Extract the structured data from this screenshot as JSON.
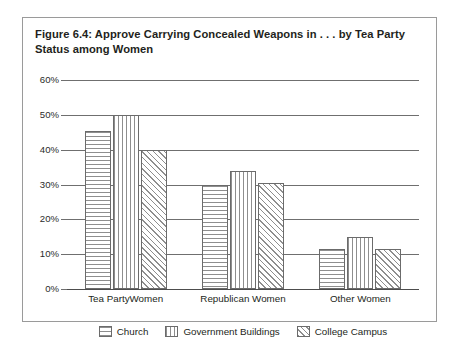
{
  "figure": {
    "title": "Figure 6.4: Approve Carrying Concealed Weapons in . . . by Tea Party Status among Women",
    "border_color": "#9a9a9a"
  },
  "chart_data": {
    "type": "bar",
    "title": "Figure 6.4: Approve Carrying Concealed Weapons in . . . by Tea Party Status among Women",
    "xlabel": "",
    "ylabel": "",
    "categories": [
      "Tea PartyWomen",
      "Republican Women",
      "Other Women"
    ],
    "series": [
      {
        "name": "Church",
        "pattern": "horizontal-lines",
        "values": [
          45.5,
          30.0,
          11.5
        ]
      },
      {
        "name": "Government Buildings",
        "pattern": "vertical-lines",
        "values": [
          50.0,
          34.0,
          15.0
        ]
      },
      {
        "name": "College Campus",
        "pattern": "diagonal-hatch",
        "values": [
          40.0,
          30.5,
          11.5
        ]
      }
    ],
    "ylim": [
      0,
      60
    ],
    "yticks": [
      0,
      10,
      20,
      30,
      40,
      50,
      60
    ],
    "ytick_labels": [
      "0%",
      "10%",
      "20%",
      "30%",
      "40%",
      "50%",
      "60%"
    ],
    "grid": true,
    "grid_axis": "y",
    "legend_position": "bottom",
    "legend_entries": [
      "Church",
      "Government Buildings",
      "College Campus"
    ],
    "bar_fill": "#ffffff",
    "bar_stroke": "#6b6b6b",
    "pattern_color": "#8e8e8e",
    "gridline_color": "#6f6f6f"
  }
}
